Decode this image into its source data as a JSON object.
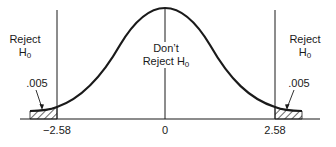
{
  "figure": {
    "type": "two-tailed hypothesis test, standard normal curve",
    "left_region": {
      "label_line1": "Reject",
      "label_line2": "H",
      "label_sub": "0",
      "tail_area": ".005"
    },
    "center_region": {
      "label_line1": "Don’t",
      "label_line2": "Reject H",
      "label_sub": "0"
    },
    "right_region": {
      "label_line1": "Reject",
      "label_line2": "H",
      "label_sub": "0",
      "tail_area": ".005"
    },
    "axis_ticks": [
      "−2.58",
      "0",
      "2.58"
    ],
    "critical_values": [
      -2.58,
      2.58
    ],
    "line_color": "#1a1a1a"
  }
}
